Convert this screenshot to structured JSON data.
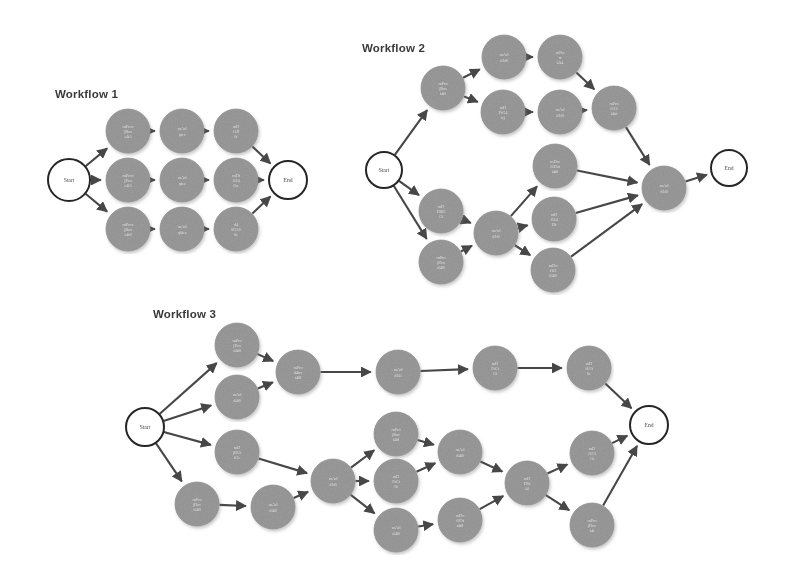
{
  "figure": {
    "background_color": "#ffffff",
    "node_fill_color": "#9b9b9b",
    "terminal_fill_color": "#ffffff",
    "edge_color": "#2e2e2e",
    "title_color": "#2b2b2b",
    "node_label_color": "#f2f2f2",
    "width": 794,
    "height": 568
  },
  "workflows": [
    {
      "id": "workflow-1",
      "title": "Workflow 1",
      "title_pos": {
        "x": 55,
        "y": 88
      },
      "terminals": [
        {
          "id": "w1-start",
          "label": "Start",
          "x": 69,
          "y": 180,
          "r": 21
        },
        {
          "id": "w1-end",
          "label": "End",
          "x": 288,
          "y": 180,
          "r": 19
        }
      ],
      "tasks": [
        {
          "id": "w1-t1",
          "label": [
            "mProc",
            "jBos",
            "c4t5"
          ],
          "x": 128,
          "y": 131,
          "r": 22
        },
        {
          "id": "w1-t2",
          "label": [
            "mAd",
            "qtes"
          ],
          "x": 182,
          "y": 131,
          "r": 22
        },
        {
          "id": "w1-t3",
          "label": [
            "mD",
            "f1JI",
            "6r"
          ],
          "x": 236,
          "y": 131,
          "r": 22
        },
        {
          "id": "w1-t4",
          "label": [
            "mProc",
            "jPen",
            "c4t5"
          ],
          "x": 128,
          "y": 180,
          "r": 22
        },
        {
          "id": "w1-t5",
          "label": [
            "mAd",
            "qtes"
          ],
          "x": 182,
          "y": 180,
          "r": 22
        },
        {
          "id": "w1-t6",
          "label": [
            "mDt",
            "f1J4",
            "6re"
          ],
          "x": 236,
          "y": 180,
          "r": 22
        },
        {
          "id": "w1-t7",
          "label": [
            "mProc",
            "jBos",
            "c4t8"
          ],
          "x": 128,
          "y": 229,
          "r": 22
        },
        {
          "id": "w1-t8",
          "label": [
            "mAd",
            "q0tes"
          ],
          "x": 182,
          "y": 229,
          "r": 22
        },
        {
          "id": "w1-t9",
          "label": [
            "d4",
            "8G3S",
            "6e"
          ],
          "x": 236,
          "y": 229,
          "r": 22
        }
      ],
      "edges": [
        [
          "w1-start",
          "w1-t1"
        ],
        [
          "w1-start",
          "w1-t4"
        ],
        [
          "w1-start",
          "w1-t7"
        ],
        [
          "w1-t1",
          "w1-t2"
        ],
        [
          "w1-t2",
          "w1-t3"
        ],
        [
          "w1-t3",
          "w1-end"
        ],
        [
          "w1-t4",
          "w1-t5"
        ],
        [
          "w1-t5",
          "w1-t6"
        ],
        [
          "w1-t6",
          "w1-end"
        ],
        [
          "w1-t7",
          "w1-t8"
        ],
        [
          "w1-t8",
          "w1-t9"
        ],
        [
          "w1-t9",
          "w1-end"
        ]
      ]
    },
    {
      "id": "workflow-2",
      "title": "Workflow 2",
      "title_pos": {
        "x": 362,
        "y": 42
      },
      "terminals": [
        {
          "id": "w2-start",
          "x": 384,
          "y": 170,
          "label": "Start",
          "r": 18
        },
        {
          "id": "w2-end",
          "x": 729,
          "y": 168,
          "label": "End",
          "r": 18
        }
      ],
      "tasks": [
        {
          "id": "w2-a",
          "label": [
            "mPro",
            "jBos",
            "t4t5"
          ],
          "x": 443,
          "y": 88,
          "r": 22
        },
        {
          "id": "w2-b",
          "label": [
            "mAd",
            "d1t8"
          ],
          "x": 504,
          "y": 57,
          "r": 22
        },
        {
          "id": "w2-c",
          "label": [
            "mNo",
            "st",
            "t2t4"
          ],
          "x": 560,
          "y": 57,
          "r": 22
        },
        {
          "id": "w2-d",
          "label": [
            "mD",
            "FrG4",
            "trj"
          ],
          "x": 503,
          "y": 112,
          "r": 22
        },
        {
          "id": "w2-e",
          "label": [
            "mAd",
            "d1t8"
          ],
          "x": 560,
          "y": 112,
          "r": 22
        },
        {
          "id": "w2-f",
          "label": [
            "mPro",
            "f1Ct",
            "t4trt"
          ],
          "x": 614,
          "y": 108,
          "r": 22
        },
        {
          "id": "w2-g",
          "label": [
            "mD",
            "D8J3",
            "Gt"
          ],
          "x": 441,
          "y": 211,
          "r": 22
        },
        {
          "id": "w2-h",
          "label": [
            "mPro",
            "jDos",
            "d4t8"
          ],
          "x": 441,
          "y": 262,
          "r": 22
        },
        {
          "id": "w2-i",
          "label": [
            "mAd",
            "d1t6"
          ],
          "x": 496,
          "y": 233,
          "r": 22
        },
        {
          "id": "w2-j",
          "label": [
            "mDro",
            "f2Dot",
            "t4t6"
          ],
          "x": 555,
          "y": 166,
          "r": 22
        },
        {
          "id": "w2-k",
          "label": [
            "mD",
            "f1J4",
            "Dt"
          ],
          "x": 554,
          "y": 219,
          "r": 22
        },
        {
          "id": "w2-l",
          "label": [
            "mDo",
            "f1t3",
            "d4t8"
          ],
          "x": 553,
          "y": 270,
          "r": 22
        },
        {
          "id": "w2-m",
          "label": [
            "mAd",
            "d1t8"
          ],
          "x": 664,
          "y": 188,
          "r": 22
        }
      ],
      "edges": [
        [
          "w2-start",
          "w2-a"
        ],
        [
          "w2-start",
          "w2-g"
        ],
        [
          "w2-start",
          "w2-h"
        ],
        [
          "w2-a",
          "w2-b"
        ],
        [
          "w2-b",
          "w2-c"
        ],
        [
          "w2-c",
          "w2-f"
        ],
        [
          "w2-a",
          "w2-d"
        ],
        [
          "w2-d",
          "w2-e"
        ],
        [
          "w2-e",
          "w2-f"
        ],
        [
          "w2-g",
          "w2-i"
        ],
        [
          "w2-h",
          "w2-i"
        ],
        [
          "w2-i",
          "w2-j"
        ],
        [
          "w2-i",
          "w2-k"
        ],
        [
          "w2-i",
          "w2-l"
        ],
        [
          "w2-f",
          "w2-m"
        ],
        [
          "w2-j",
          "w2-m"
        ],
        [
          "w2-k",
          "w2-m"
        ],
        [
          "w2-l",
          "w2-m"
        ],
        [
          "w2-m",
          "w2-end"
        ]
      ]
    },
    {
      "id": "workflow-3",
      "title": "Workflow 3",
      "title_pos": {
        "x": 153,
        "y": 308
      },
      "terminals": [
        {
          "id": "w3-start",
          "x": 145,
          "y": 427,
          "label": "Start",
          "r": 19
        },
        {
          "id": "w3-end",
          "x": 649,
          "y": 425,
          "label": "End",
          "r": 19
        }
      ],
      "tasks": [
        {
          "id": "w3-a",
          "label": [
            "mPro",
            "jPen",
            "d4t8"
          ],
          "x": 237,
          "y": 345,
          "r": 22
        },
        {
          "id": "w3-b",
          "label": [
            "mAd",
            "d4t8"
          ],
          "x": 237,
          "y": 397,
          "r": 22
        },
        {
          "id": "w3-c",
          "label": [
            "mPro",
            "d4trc",
            "t4t8"
          ],
          "x": 298,
          "y": 372,
          "r": 22
        },
        {
          "id": "w3-d",
          "label": [
            "mAd",
            "d1t5"
          ],
          "x": 398,
          "y": 372,
          "r": 22
        },
        {
          "id": "w3-e",
          "label": [
            "mD",
            "FrCt",
            "Gt"
          ],
          "x": 495,
          "y": 368,
          "r": 22
        },
        {
          "id": "w3-f",
          "label": [
            "mD",
            "f1Gt",
            "6e"
          ],
          "x": 589,
          "y": 368,
          "r": 22
        },
        {
          "id": "w3-g",
          "label": [
            "mD",
            "jBGt",
            "tGe"
          ],
          "x": 237,
          "y": 452,
          "r": 22
        },
        {
          "id": "w3-h",
          "label": [
            "mPro",
            "jDoc",
            "d4t8"
          ],
          "x": 197,
          "y": 504,
          "r": 22
        },
        {
          "id": "w3-i",
          "label": [
            "mAd",
            "d4t8"
          ],
          "x": 273,
          "y": 507,
          "r": 22
        },
        {
          "id": "w3-j",
          "label": [
            "mAd",
            "d1t6"
          ],
          "x": 333,
          "y": 481,
          "r": 22
        },
        {
          "id": "w3-k",
          "label": [
            "mPro",
            "jBoc",
            "t4t8"
          ],
          "x": 396,
          "y": 434,
          "r": 22
        },
        {
          "id": "w3-l",
          "label": [
            "mD",
            "FrCt",
            "6t"
          ],
          "x": 396,
          "y": 481,
          "r": 22
        },
        {
          "id": "w3-m",
          "label": [
            "mAd",
            "d4t8"
          ],
          "x": 396,
          "y": 530,
          "r": 22
        },
        {
          "id": "w3-n",
          "label": [
            "mAd",
            "d4t8"
          ],
          "x": 460,
          "y": 452,
          "r": 22
        },
        {
          "id": "w3-o",
          "label": [
            "mDo",
            "f2Ot",
            "t4t8"
          ],
          "x": 460,
          "y": 520,
          "r": 22
        },
        {
          "id": "w3-p",
          "label": [
            "mD",
            "D6t",
            "t4"
          ],
          "x": 527,
          "y": 483,
          "r": 22
        },
        {
          "id": "w3-q",
          "label": [
            "mD",
            "f1Gt",
            "Gt"
          ],
          "x": 592,
          "y": 453,
          "r": 22
        },
        {
          "id": "w3-r",
          "label": [
            "mPro",
            "jDoc",
            "t4t"
          ],
          "x": 592,
          "y": 525,
          "r": 22
        }
      ],
      "edges": [
        [
          "w3-start",
          "w3-a"
        ],
        [
          "w3-start",
          "w3-b"
        ],
        [
          "w3-start",
          "w3-g"
        ],
        [
          "w3-start",
          "w3-h"
        ],
        [
          "w3-a",
          "w3-c"
        ],
        [
          "w3-b",
          "w3-c"
        ],
        [
          "w3-c",
          "w3-d"
        ],
        [
          "w3-d",
          "w3-e"
        ],
        [
          "w3-e",
          "w3-f"
        ],
        [
          "w3-f",
          "w3-end"
        ],
        [
          "w3-h",
          "w3-i"
        ],
        [
          "w3-i",
          "w3-j"
        ],
        [
          "w3-g",
          "w3-j"
        ],
        [
          "w3-j",
          "w3-k"
        ],
        [
          "w3-j",
          "w3-l"
        ],
        [
          "w3-j",
          "w3-m"
        ],
        [
          "w3-k",
          "w3-n"
        ],
        [
          "w3-l",
          "w3-n"
        ],
        [
          "w3-m",
          "w3-o"
        ],
        [
          "w3-n",
          "w3-p"
        ],
        [
          "w3-o",
          "w3-p"
        ],
        [
          "w3-p",
          "w3-q"
        ],
        [
          "w3-p",
          "w3-r"
        ],
        [
          "w3-q",
          "w3-end"
        ],
        [
          "w3-r",
          "w3-end"
        ]
      ]
    }
  ]
}
